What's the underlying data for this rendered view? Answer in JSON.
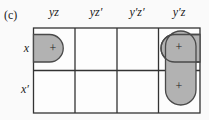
{
  "figure_label": "(c)",
  "kmap": {
    "column_headers": [
      "yz",
      "yz′",
      "y′z′",
      "y′z"
    ],
    "row_headers": [
      "x",
      "x′"
    ],
    "marks": [
      {
        "cell": "x,yz",
        "symbol": "+"
      },
      {
        "cell": "x,y′z",
        "symbol": "+"
      },
      {
        "cell": "x′,y′z",
        "symbol": "+"
      }
    ],
    "groups": [
      {
        "id": "wraparound-x-z",
        "cells": [
          "x,yz",
          "x,y′z"
        ],
        "shape": "horizontal wrap-around pair split at map edges"
      },
      {
        "id": "yprime-z-column",
        "cells": [
          "x,y′z",
          "x′,y′z"
        ],
        "shape": "vertical pill spanning both rows"
      }
    ],
    "colors": {
      "group_fill": "#b2b2b2",
      "group_stroke": "#4a4a4a",
      "grid_line": "#333333",
      "cell_background": "#fdfdfd",
      "page_background": "#fafafa",
      "text": "#1a1a1a"
    }
  }
}
